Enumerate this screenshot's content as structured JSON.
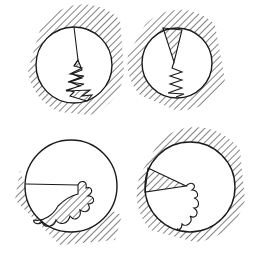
{
  "figure": {
    "stroke_color": "#1a1a1a",
    "background_color": "#ffffff",
    "panels": [
      {
        "id": "top-left",
        "cx": 74,
        "cy": 65,
        "r": 38,
        "feature": "radial line with zigzag crack at bottom"
      },
      {
        "id": "top-right",
        "cx": 177,
        "cy": 63,
        "r": 35,
        "feature": "hatched wedge with zigzag crack"
      },
      {
        "id": "bottom-left",
        "cx": 71,
        "cy": 186,
        "r": 46,
        "feature": "horizontal line with wavy hatched lobes"
      },
      {
        "id": "bottom-right",
        "cx": 190,
        "cy": 187,
        "r": 45,
        "feature": "hatched wedge with wavy crack"
      }
    ]
  }
}
